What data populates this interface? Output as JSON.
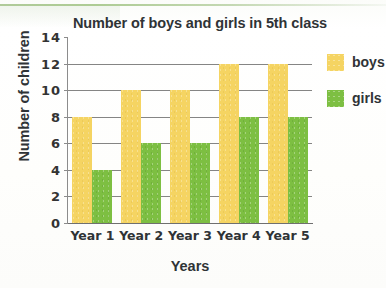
{
  "chart_data": {
    "type": "bar",
    "title": "Number of boys and girls in 5th class",
    "xlabel": "Years",
    "ylabel": "Number of children",
    "categories": [
      "Year 1",
      "Year 2",
      "Year 3",
      "Year 4",
      "Year 5"
    ],
    "series": [
      {
        "name": "boys",
        "color": "#F5D462",
        "values": [
          8,
          10,
          10,
          12,
          12
        ]
      },
      {
        "name": "girls",
        "color": "#7DBF42",
        "values": [
          4,
          6,
          6,
          8,
          8
        ]
      }
    ],
    "ylim": [
      0,
      14
    ],
    "yticks": [
      0,
      2,
      4,
      6,
      8,
      10,
      12,
      14
    ],
    "ytick_labels": [
      "0",
      "2",
      "4",
      "6",
      "8",
      "10",
      "12",
      "14"
    ],
    "gridlines_at": [
      2,
      4,
      6,
      8,
      10,
      12
    ],
    "grid": true,
    "legend_position": "right",
    "legend": [
      {
        "label": "boys",
        "color": "#F5D462"
      },
      {
        "label": "girls",
        "color": "#7DBF42"
      }
    ]
  }
}
